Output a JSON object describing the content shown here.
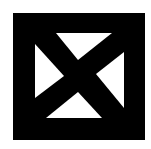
{
  "icon": {
    "name": "box-with-x",
    "colors": {
      "foreground": "#000000",
      "background": "#ffffff"
    }
  }
}
